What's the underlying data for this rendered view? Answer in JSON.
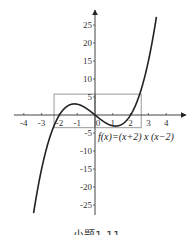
{
  "chart_data": {
    "type": "line",
    "title": "",
    "function_label": "f(x)=(x+2) x (x−2)",
    "xlabel": "",
    "ylabel": "",
    "xlim": [
      -4.5,
      5
    ],
    "ylim": [
      -27,
      28
    ],
    "x_ticks": [
      -4,
      -3,
      -2,
      -1,
      0,
      1,
      2,
      3,
      4
    ],
    "x_tick_labels": [
      "-4",
      "-3",
      "-2",
      "-1",
      "0",
      "1",
      "2",
      "3",
      "4"
    ],
    "y_ticks": [
      25,
      20,
      15,
      10,
      5,
      -5,
      -10,
      -15,
      -20,
      -25
    ],
    "y_tick_labels": [
      "25",
      "20",
      "15",
      "10",
      "5",
      "-5",
      "-10",
      "-15",
      "-20",
      "-25"
    ],
    "grid": false,
    "series": [
      {
        "name": "f(x)=(x+2)x(x-2)",
        "x": [
          -3.45,
          -3,
          -2.5,
          -2,
          -1.5,
          -1.155,
          -1,
          -0.5,
          0,
          0.5,
          1,
          1.155,
          1.5,
          2,
          2.5,
          3,
          3.45
        ],
        "y": [
          -27.2,
          -15,
          -5.6,
          0,
          2.6,
          3.08,
          3,
          1.9,
          0,
          -1.9,
          -3,
          -3.08,
          -2.6,
          0,
          5.6,
          15,
          27.2
        ]
      }
    ],
    "annotations": [
      {
        "type": "rectangle",
        "x": [
          -2.3,
          0
        ],
        "y": [
          -3.5,
          5.8
        ],
        "color": "#aaaaaa"
      },
      {
        "type": "rectangle",
        "x": [
          0,
          2.6
        ],
        "y": [
          -3.5,
          5.8
        ],
        "color": "#aaaaaa"
      }
    ],
    "colors": {
      "curve": "#222222",
      "axis": "#444444",
      "rect": "#aaaaaa"
    }
  },
  "caption": "小题1-11"
}
